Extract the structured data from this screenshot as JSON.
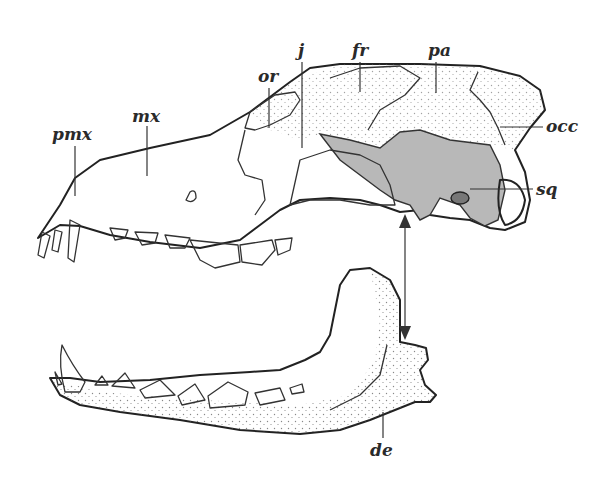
{
  "figure": {
    "colors": {
      "ink": "#222222",
      "squamosal_fill": "#b8b8b8",
      "bone_fill": "#ffffff",
      "mandible_fill": "#f3f3f3"
    },
    "labels": [
      {
        "id": "pmx",
        "text": "pmx",
        "x": 52,
        "y": 133
      },
      {
        "id": "mx",
        "text": "mx",
        "x": 104,
        "y": 118
      },
      {
        "id": "or",
        "text": "or",
        "x": 262,
        "y": 82
      },
      {
        "id": "j",
        "text": "j",
        "x": 300,
        "y": 56
      },
      {
        "id": "fr",
        "text": "fr",
        "x": 352,
        "y": 56
      },
      {
        "id": "pa",
        "text": "pa",
        "x": 431,
        "y": 56
      },
      {
        "id": "occ",
        "text": "occ",
        "x": 545,
        "y": 132
      },
      {
        "id": "sq",
        "text": "sq",
        "x": 536,
        "y": 194
      },
      {
        "id": "de",
        "text": "de",
        "x": 370,
        "y": 456
      }
    ],
    "arrow": {
      "type": "double-headed",
      "x": 405,
      "from_y": 216,
      "to_y": 338
    }
  }
}
